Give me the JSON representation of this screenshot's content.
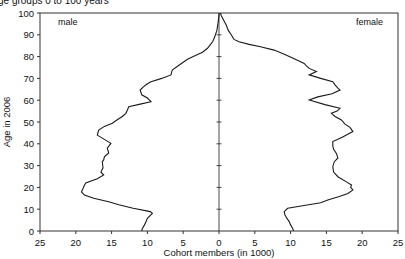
{
  "chart_data": {
    "type": "line",
    "subtype": "population-pyramid",
    "title": "ge groups 0 to 100 years",
    "xlabel": "Cohort members (in 1000)",
    "ylabel": "Age in 2006",
    "xlim": [
      -25,
      25
    ],
    "ylim": [
      0,
      100
    ],
    "x_tick_labels": [
      "25",
      "20",
      "15",
      "10",
      "5",
      "0",
      "5",
      "10",
      "15",
      "20",
      "25"
    ],
    "x_tick_values": [
      -25,
      -20,
      -15,
      -10,
      -5,
      0,
      5,
      10,
      15,
      20,
      25
    ],
    "y_tick_labels": [
      "0",
      "10",
      "20",
      "30",
      "40",
      "50",
      "60",
      "70",
      "80",
      "90",
      "100"
    ],
    "y_tick_values": [
      0,
      10,
      20,
      30,
      40,
      50,
      60,
      70,
      80,
      90,
      100
    ],
    "grid": false,
    "legend": "inline labels",
    "series": [
      {
        "name": "male",
        "side": "left",
        "points": [
          [
            0,
            10.8
          ],
          [
            1.2,
            10.7
          ],
          [
            2.8,
            10.4
          ],
          [
            4.3,
            10.2
          ],
          [
            5.8,
            10.0
          ],
          [
            8.1,
            9.3
          ],
          [
            8.9,
            9.6
          ],
          [
            10.4,
            12.0
          ],
          [
            12.0,
            14.0
          ],
          [
            13.4,
            15.4
          ],
          [
            15.0,
            17.5
          ],
          [
            16.5,
            18.8
          ],
          [
            18.0,
            19.2
          ],
          [
            19.5,
            19.0
          ],
          [
            21.0,
            18.8
          ],
          [
            22.0,
            18.6
          ],
          [
            24.0,
            17.0
          ],
          [
            25.7,
            16.1
          ],
          [
            27.0,
            16.5
          ],
          [
            29.0,
            16.2
          ],
          [
            31.8,
            16.3
          ],
          [
            32.6,
            16.1
          ],
          [
            34.0,
            16.0
          ],
          [
            35.8,
            15.4
          ],
          [
            38.0,
            15.6
          ],
          [
            40.2,
            15.1
          ],
          [
            42.0,
            16.0
          ],
          [
            44.0,
            17.0
          ],
          [
            46.3,
            16.8
          ],
          [
            48.0,
            16.0
          ],
          [
            49.4,
            14.9
          ],
          [
            51.0,
            14.2
          ],
          [
            52.5,
            13.5
          ],
          [
            54.0,
            13.0
          ],
          [
            55.5,
            12.8
          ],
          [
            57.0,
            12.6
          ],
          [
            58.2,
            11.0
          ],
          [
            59.3,
            9.5
          ],
          [
            61.0,
            10.0
          ],
          [
            62.5,
            10.8
          ],
          [
            64.7,
            11.0
          ],
          [
            66.0,
            10.6
          ],
          [
            67.5,
            10.0
          ],
          [
            68.5,
            9.5
          ],
          [
            70.0,
            8.0
          ],
          [
            71.6,
            6.7
          ],
          [
            73.0,
            6.6
          ],
          [
            73.9,
            6.5
          ],
          [
            76.0,
            5.6
          ],
          [
            78.8,
            4.4
          ],
          [
            80.5,
            3.3
          ],
          [
            82.0,
            2.3
          ],
          [
            83.8,
            1.6
          ],
          [
            85.5,
            1.2
          ],
          [
            86.8,
            0.9
          ],
          [
            89.0,
            0.6
          ],
          [
            92.0,
            0.3
          ],
          [
            95.0,
            0.15
          ],
          [
            99.0,
            0.0
          ],
          [
            100,
            0.0
          ]
        ]
      },
      {
        "name": "female",
        "side": "right",
        "points": [
          [
            0,
            10.4
          ],
          [
            1.2,
            10.3
          ],
          [
            2.8,
            10.0
          ],
          [
            4.3,
            9.8
          ],
          [
            5.8,
            9.5
          ],
          [
            7.5,
            9.2
          ],
          [
            8.9,
            9.1
          ],
          [
            10.4,
            9.6
          ],
          [
            12.0,
            12.5
          ],
          [
            13.0,
            14.2
          ],
          [
            14.2,
            15.2
          ],
          [
            15.8,
            16.8
          ],
          [
            17.2,
            18.0
          ],
          [
            18.8,
            18.7
          ],
          [
            20.0,
            18.4
          ],
          [
            21.1,
            18.5
          ],
          [
            22.5,
            17.8
          ],
          [
            24.9,
            16.6
          ],
          [
            27.0,
            16.0
          ],
          [
            29.5,
            15.9
          ],
          [
            31.8,
            16.1
          ],
          [
            33.5,
            16.6
          ],
          [
            35.6,
            16.4
          ],
          [
            37.5,
            16.0
          ],
          [
            39.0,
            15.9
          ],
          [
            41.0,
            15.9
          ],
          [
            43.0,
            17.2
          ],
          [
            45.6,
            18.7
          ],
          [
            47.5,
            18.3
          ],
          [
            49.0,
            17.6
          ],
          [
            50.9,
            17.1
          ],
          [
            52.5,
            16.2
          ],
          [
            54.0,
            15.7
          ],
          [
            55.0,
            16.5
          ],
          [
            56.3,
            16.9
          ],
          [
            58.0,
            14.8
          ],
          [
            60.1,
            12.6
          ],
          [
            61.5,
            13.8
          ],
          [
            63.0,
            15.8
          ],
          [
            64.7,
            16.9
          ],
          [
            65.5,
            16.6
          ],
          [
            67.0,
            16.2
          ],
          [
            68.5,
            15.9
          ],
          [
            70.0,
            14.2
          ],
          [
            71.6,
            12.6
          ],
          [
            73.1,
            13.6
          ],
          [
            74.6,
            12.6
          ],
          [
            75.8,
            12.2
          ],
          [
            76.9,
            11.9
          ],
          [
            79.0,
            10.5
          ],
          [
            81.0,
            9.2
          ],
          [
            83.0,
            7.7
          ],
          [
            84.5,
            5.8
          ],
          [
            85.6,
            4.2
          ],
          [
            86.8,
            2.8
          ],
          [
            87.9,
            2.1
          ],
          [
            90.0,
            1.7
          ],
          [
            92.0,
            1.3
          ],
          [
            94.5,
            1.0
          ],
          [
            97.0,
            0.6
          ],
          [
            99.0,
            0.3
          ],
          [
            100,
            0.2
          ]
        ]
      }
    ]
  },
  "labels": {
    "title": "ge groups 0 to 100 years",
    "male": "male",
    "female": "female",
    "xlabel": "Cohort members (in 1000)",
    "ylabel": "Age in 2006"
  },
  "colors": {
    "line": "#1a1a1a",
    "axis": "#333333",
    "background": "#ffffff"
  }
}
